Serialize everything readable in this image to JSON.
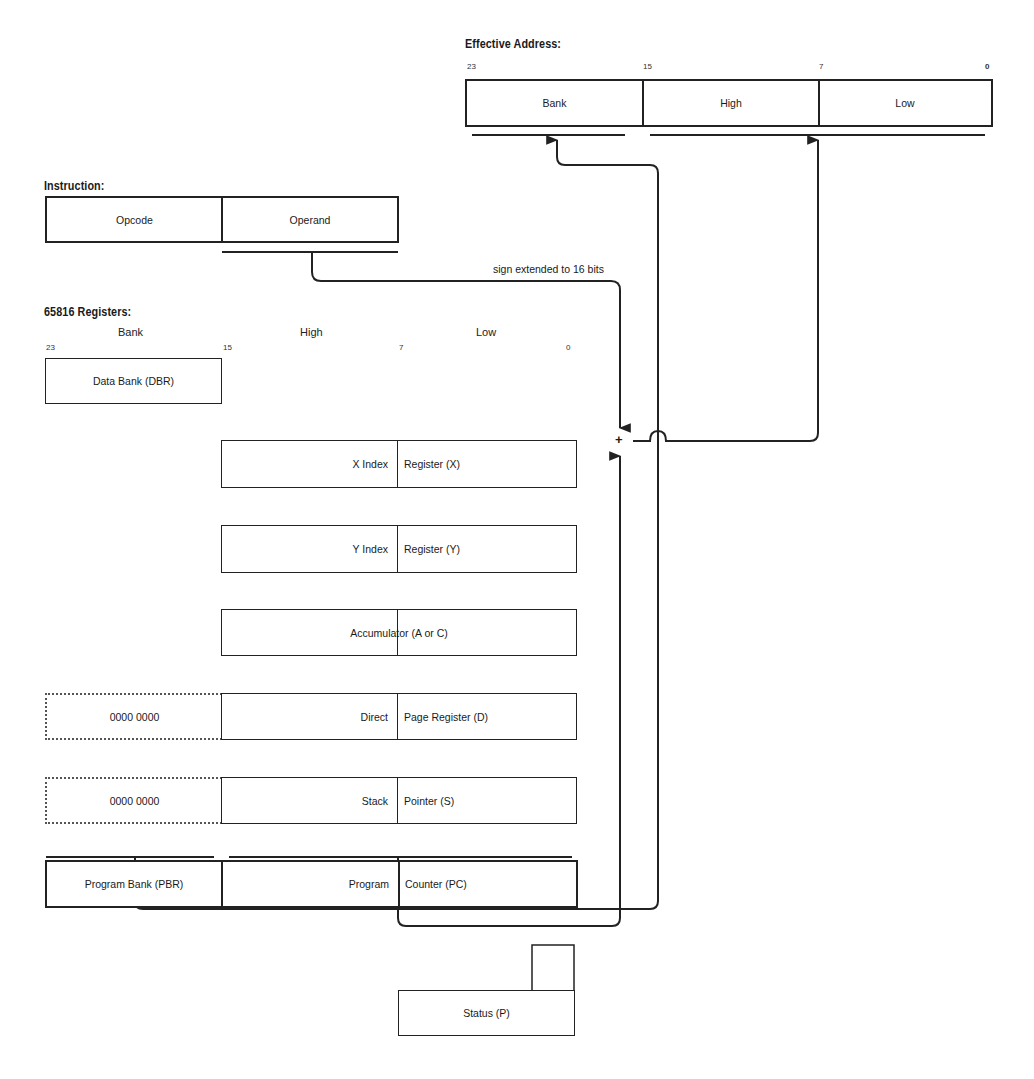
{
  "header_fragment": "",
  "effective_address": {
    "title": "Effective Address:",
    "bits": {
      "b23": "23",
      "b15": "15",
      "b7": "7",
      "b0": "0"
    },
    "fields": [
      "Bank",
      "High",
      "Low"
    ]
  },
  "instruction": {
    "title": "Instruction:",
    "fields": [
      "Opcode",
      "Operand"
    ]
  },
  "annotation": "sign extended to 16 bits",
  "adder_symbol": "+",
  "registers": {
    "title": "65816 Registers:",
    "columns": [
      "Bank",
      "High",
      "Low"
    ],
    "bits": {
      "b23": "23",
      "b15": "15",
      "b7": "7",
      "b0": "0"
    },
    "dbr": "Data Bank (DBR)",
    "x": {
      "left": "X Index",
      "right": "Register (X)"
    },
    "y": {
      "left": "Y Index",
      "right": "Register (Y)"
    },
    "acc": {
      "label": "Accumulator (A or C)"
    },
    "d": {
      "bank": "0000 0000",
      "left": "Direct",
      "right": "Page Register (D)"
    },
    "s": {
      "bank": "0000 0000",
      "left": "Stack",
      "right": "Pointer (S)"
    },
    "pc": {
      "bank": "Program Bank (PBR)",
      "left": "Program",
      "right": "Counter (PC)"
    },
    "status": "Status (P)"
  }
}
